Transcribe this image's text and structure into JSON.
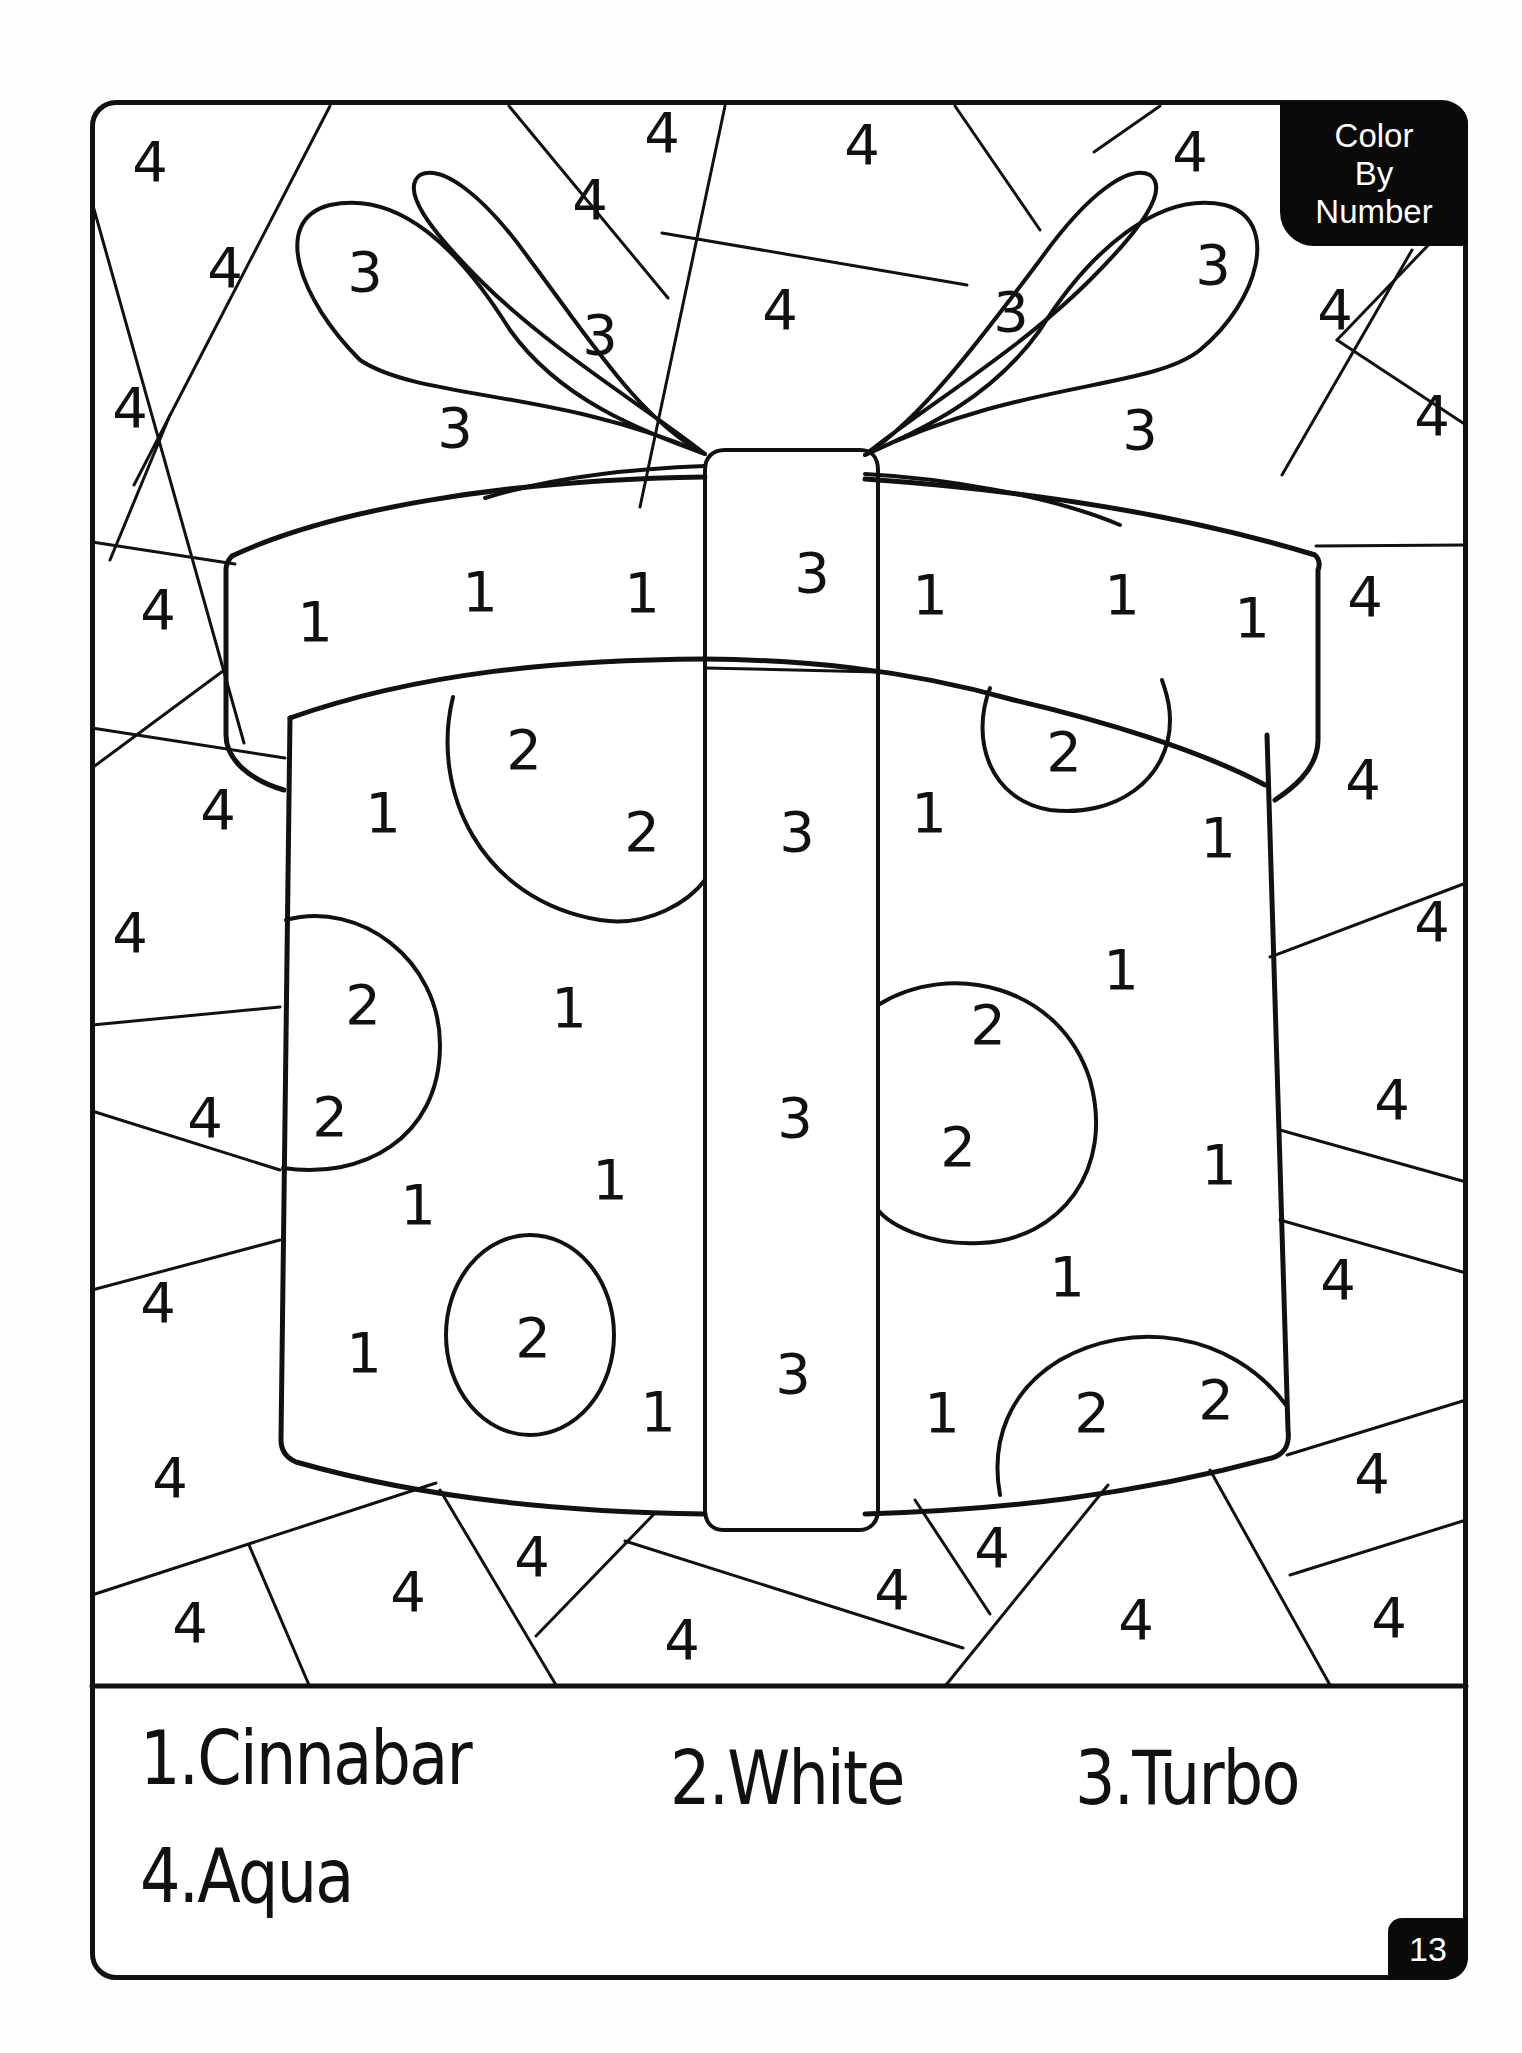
{
  "badge": {
    "line1": "Color",
    "line2": "By",
    "line3": "Number"
  },
  "page_number": "13",
  "legend": [
    {
      "number": 1,
      "label": "1.Cinnabar",
      "color": "#e34234"
    },
    {
      "number": 2,
      "label": "2.White",
      "color": "#ffffff"
    },
    {
      "number": 3,
      "label": "3.Turbo",
      "color": "#fae600"
    },
    {
      "number": 4,
      "label": "4.Aqua",
      "color": "#00ffff"
    }
  ],
  "regions": {
    "background": [
      {
        "n": "4",
        "x": 150,
        "y": 162
      },
      {
        "n": "4",
        "x": 662,
        "y": 133
      },
      {
        "n": "4",
        "x": 862,
        "y": 145
      },
      {
        "n": "4",
        "x": 1190,
        "y": 152
      },
      {
        "n": "4",
        "x": 590,
        "y": 200
      },
      {
        "n": "4",
        "x": 225,
        "y": 268
      },
      {
        "n": "4",
        "x": 780,
        "y": 310
      },
      {
        "n": "4",
        "x": 1335,
        "y": 310
      },
      {
        "n": "4",
        "x": 130,
        "y": 408
      },
      {
        "n": "4",
        "x": 1432,
        "y": 416
      },
      {
        "n": "4",
        "x": 158,
        "y": 610
      },
      {
        "n": "4",
        "x": 1365,
        "y": 597
      },
      {
        "n": "4",
        "x": 218,
        "y": 810
      },
      {
        "n": "4",
        "x": 1363,
        "y": 780
      },
      {
        "n": "4",
        "x": 130,
        "y": 933
      },
      {
        "n": "4",
        "x": 1432,
        "y": 922
      },
      {
        "n": "4",
        "x": 205,
        "y": 1118
      },
      {
        "n": "4",
        "x": 1392,
        "y": 1100
      },
      {
        "n": "4",
        "x": 158,
        "y": 1303
      },
      {
        "n": "4",
        "x": 1338,
        "y": 1280
      },
      {
        "n": "4",
        "x": 170,
        "y": 1478
      },
      {
        "n": "4",
        "x": 1372,
        "y": 1474
      },
      {
        "n": "4",
        "x": 190,
        "y": 1623
      },
      {
        "n": "4",
        "x": 408,
        "y": 1592
      },
      {
        "n": "4",
        "x": 532,
        "y": 1557
      },
      {
        "n": "4",
        "x": 682,
        "y": 1640
      },
      {
        "n": "4",
        "x": 892,
        "y": 1590
      },
      {
        "n": "4",
        "x": 992,
        "y": 1548
      },
      {
        "n": "4",
        "x": 1136,
        "y": 1620
      },
      {
        "n": "4",
        "x": 1389,
        "y": 1618
      }
    ],
    "bow": [
      {
        "n": "3",
        "x": 365,
        "y": 272
      },
      {
        "n": "3",
        "x": 600,
        "y": 335
      },
      {
        "n": "3",
        "x": 455,
        "y": 428
      },
      {
        "n": "3",
        "x": 1213,
        "y": 265
      },
      {
        "n": "3",
        "x": 1011,
        "y": 312
      },
      {
        "n": "3",
        "x": 1140,
        "y": 430
      }
    ],
    "lid": [
      {
        "n": "1",
        "x": 315,
        "y": 622
      },
      {
        "n": "1",
        "x": 480,
        "y": 592
      },
      {
        "n": "1",
        "x": 642,
        "y": 593
      },
      {
        "n": "3",
        "x": 812,
        "y": 573
      },
      {
        "n": "1",
        "x": 930,
        "y": 595
      },
      {
        "n": "1",
        "x": 1122,
        "y": 595
      },
      {
        "n": "1",
        "x": 1252,
        "y": 618
      }
    ],
    "box": [
      {
        "n": "2",
        "x": 524,
        "y": 750
      },
      {
        "n": "1",
        "x": 383,
        "y": 813
      },
      {
        "n": "2",
        "x": 642,
        "y": 832
      },
      {
        "n": "3",
        "x": 797,
        "y": 832
      },
      {
        "n": "1",
        "x": 929,
        "y": 813
      },
      {
        "n": "2",
        "x": 1064,
        "y": 752
      },
      {
        "n": "1",
        "x": 1218,
        "y": 838
      },
      {
        "n": "2",
        "x": 363,
        "y": 1005
      },
      {
        "n": "1",
        "x": 569,
        "y": 1008
      },
      {
        "n": "1",
        "x": 1121,
        "y": 970
      },
      {
        "n": "2",
        "x": 988,
        "y": 1025
      },
      {
        "n": "2",
        "x": 330,
        "y": 1117
      },
      {
        "n": "3",
        "x": 795,
        "y": 1118
      },
      {
        "n": "2",
        "x": 958,
        "y": 1147
      },
      {
        "n": "1",
        "x": 1219,
        "y": 1165
      },
      {
        "n": "1",
        "x": 418,
        "y": 1205
      },
      {
        "n": "1",
        "x": 610,
        "y": 1180
      },
      {
        "n": "1",
        "x": 1067,
        "y": 1277
      },
      {
        "n": "1",
        "x": 364,
        "y": 1353
      },
      {
        "n": "2",
        "x": 533,
        "y": 1338
      },
      {
        "n": "1",
        "x": 658,
        "y": 1412
      },
      {
        "n": "3",
        "x": 793,
        "y": 1374
      },
      {
        "n": "1",
        "x": 942,
        "y": 1413
      },
      {
        "n": "2",
        "x": 1092,
        "y": 1413
      },
      {
        "n": "2",
        "x": 1216,
        "y": 1400
      }
    ]
  }
}
